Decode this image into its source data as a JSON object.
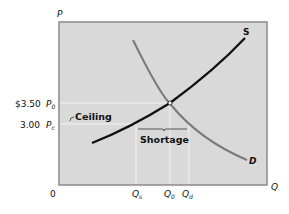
{
  "diagram": {
    "type": "supply-demand-price-ceiling",
    "axes": {
      "y_label": "P",
      "x_label": "Q",
      "origin_label": "0"
    },
    "curves": {
      "supply_label": "S",
      "demand_label": "D"
    },
    "price_labels": {
      "p0_value": "$3.50",
      "p0_symbol": "P",
      "p0_sub": "0",
      "pc_value": "3.00",
      "pc_symbol": "P",
      "pc_sub": "c"
    },
    "quantity_labels": {
      "qs_symbol": "Q",
      "qs_sub": "s",
      "q0_symbol": "Q",
      "q0_sub": "0",
      "qd_symbol": "Q",
      "qd_sub": "d"
    },
    "annotations": {
      "ceiling": "Ceiling",
      "shortage": "Shortage"
    },
    "colors": {
      "plot_bg": "#d9d9d9",
      "plot_border": "#8a8a8a",
      "supply": "#111111",
      "demand": "#7a7a7a",
      "guide": "#f2f2f2"
    }
  }
}
